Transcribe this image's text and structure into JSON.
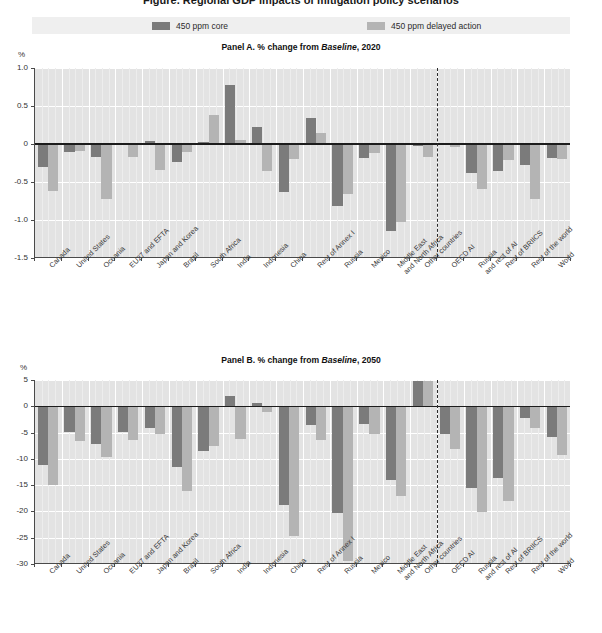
{
  "figure": {
    "clipped_title": "Figure. Regional GDP impacts of mitigation policy scenarios",
    "legend": [
      {
        "label": "450 ppm core",
        "color": "#7b7b7b",
        "key": "core"
      },
      {
        "label": "450 ppm delayed action",
        "color": "#b4b4b4",
        "key": "delayed"
      }
    ],
    "axis_unit": "%"
  },
  "panelA": {
    "title_prefix": "Panel A. % change from ",
    "title_italic": "Baseline",
    "title_suffix": ", 2020",
    "yticks": [
      "1.0",
      "0.5",
      "0",
      "-0.5",
      "-1.0",
      "-1.5"
    ]
  },
  "panelB": {
    "title_prefix": "Panel B. % change from ",
    "title_italic": "Baseline",
    "title_suffix": ", 2050",
    "yticks": [
      "5",
      "0",
      "-5",
      "-10",
      "-15",
      "-20",
      "-25",
      "-30"
    ]
  },
  "chart_data": [
    {
      "type": "bar",
      "title": "Panel A. % change from Baseline, 2020",
      "xlabel": "",
      "ylabel": "%",
      "ylim": [
        -1.5,
        1.0
      ],
      "ytick_values": [
        1.0,
        0.5,
        0,
        -0.5,
        -1.0,
        -1.5
      ],
      "grid": true,
      "legend_position": "top",
      "categories": [
        "Canada",
        "United States",
        "Oceania",
        "EU27 and EFTA",
        "Japan and Korea",
        "Brazil",
        "South Africa",
        "India",
        "Indonesia",
        "China",
        "Rest of Annex I",
        "Russia",
        "Mexico",
        "Middle East and North Africa",
        "Other countries",
        "OECD AI",
        "Russia and rest of AI",
        "Rest of BRIICS",
        "Rest of the world",
        "World"
      ],
      "group_break_after": "Other countries",
      "series": [
        {
          "name": "450 ppm core",
          "color": "#7b7b7b",
          "values": [
            -0.3,
            -0.1,
            -0.17,
            -0.01,
            0.04,
            -0.24,
            0.02,
            0.77,
            0.22,
            -0.63,
            0.34,
            -0.82,
            -0.18,
            -1.15,
            -0.02,
            0.01,
            -0.38,
            -0.35,
            -0.27,
            -0.19
          ]
        },
        {
          "name": "450 ppm delayed action",
          "color": "#b4b4b4",
          "values": [
            -0.62,
            -0.09,
            -0.73,
            -0.17,
            -0.34,
            -0.1,
            0.38,
            0.05,
            -0.36,
            -0.2,
            0.15,
            -0.66,
            -0.12,
            -1.02,
            -0.17,
            -0.04,
            -0.59,
            -0.21,
            -0.72,
            -0.2
          ]
        }
      ]
    },
    {
      "type": "bar",
      "title": "Panel B. % change from Baseline, 2050",
      "xlabel": "",
      "ylabel": "%",
      "ylim": [
        -30,
        5
      ],
      "ytick_values": [
        5,
        0,
        -5,
        -10,
        -15,
        -20,
        -25,
        -30
      ],
      "grid": true,
      "legend_position": "top",
      "categories": [
        "Canada",
        "United States",
        "Oceania",
        "EU27 and EFTA",
        "Japan and Korea",
        "Brazil",
        "South Africa",
        "India",
        "Indonesia",
        "China",
        "Rest of Annex I",
        "Russia",
        "Mexico",
        "Middle East and North Africa",
        "Other countries",
        "OECD AI",
        "Russia and rest of AI",
        "Rest of BRIICS",
        "Rest of the world",
        "World"
      ],
      "group_break_after": "Other countries",
      "series": [
        {
          "name": "450 ppm core",
          "color": "#7b7b7b",
          "values": [
            -11.2,
            -4.8,
            -7.1,
            -4.9,
            -4.1,
            -11.5,
            -8.6,
            1.9,
            0.7,
            -18.8,
            -3.5,
            -20.3,
            -3.4,
            -14.1,
            4.9,
            -5.2,
            -15.5,
            -13.6,
            -2.2,
            -5.8
          ]
        },
        {
          "name": "450 ppm delayed action",
          "color": "#b4b4b4",
          "values": [
            -14.9,
            -6.6,
            -9.6,
            -6.4,
            -5.3,
            -16.2,
            -7.5,
            -6.2,
            -1.0,
            -24.6,
            -6.5,
            -29.5,
            -5.2,
            -17.0,
            4.9,
            -8.1,
            -20.1,
            -18.0,
            -4.2,
            -9.2
          ]
        }
      ]
    }
  ],
  "xlabels": [
    "Canada",
    "United States",
    "Oceania",
    "EU27 and EFTA",
    "Japan and Korea",
    "Brazil",
    "South Africa",
    "India",
    "Indonesia",
    "China",
    "Rest of Annex I",
    "Russia",
    "Mexico",
    "Middle East\nand North Africa",
    "Other countries",
    "OECD AI",
    "Russia\nand rest of AI",
    "Rest of BRIICS",
    "Rest of the world",
    "World"
  ]
}
